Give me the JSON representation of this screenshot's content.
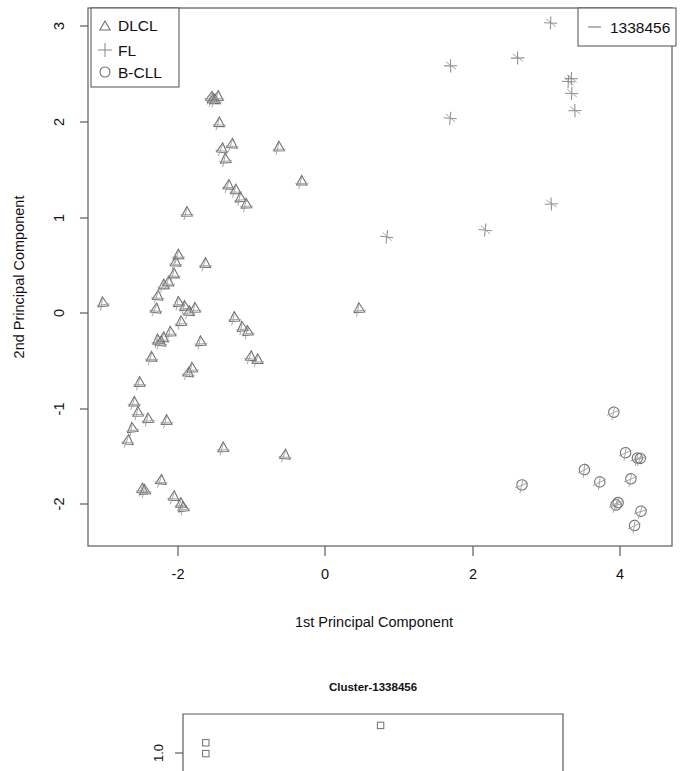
{
  "chart_data": {
    "type": "scatter",
    "title": "",
    "xlabel": "1st Principal Component",
    "ylabel": "2nd Principal Component",
    "xlim": [
      -3.2,
      4.6
    ],
    "ylim": [
      -2.45,
      3.15
    ],
    "xticks": [
      "-2",
      "0",
      "2",
      "4"
    ],
    "xtick_values": [
      -2,
      0,
      2,
      4
    ],
    "yticks": [
      "-2",
      "-1",
      "0",
      "1",
      "2",
      "3"
    ],
    "ytick_values": [
      -2,
      -1,
      0,
      1,
      2,
      3
    ],
    "grid": false,
    "legend_position": "top-left",
    "series": [
      {
        "name": "DLCL",
        "marker": "triangle",
        "color": "#6e6e6e",
        "points": [
          [
            -3.0,
            0.1
          ],
          [
            -2.66,
            -1.32
          ],
          [
            -2.63,
            -1.2
          ],
          [
            -2.6,
            -0.93
          ],
          [
            -2.55,
            -1.04
          ],
          [
            -2.52,
            -0.72
          ],
          [
            -2.48,
            -1.85
          ],
          [
            -2.45,
            -1.86
          ],
          [
            -2.4,
            -1.1
          ],
          [
            -2.34,
            -0.45
          ],
          [
            -2.3,
            0.05
          ],
          [
            -2.28,
            0.18
          ],
          [
            -2.26,
            -0.28
          ],
          [
            -2.24,
            -0.3
          ],
          [
            -2.22,
            -1.75
          ],
          [
            -2.2,
            0.3
          ],
          [
            -2.18,
            -0.26
          ],
          [
            -2.15,
            -1.12
          ],
          [
            -2.12,
            0.33
          ],
          [
            -2.1,
            -0.2
          ],
          [
            -2.06,
            -1.92
          ],
          [
            -2.04,
            0.42
          ],
          [
            -2.02,
            0.54
          ],
          [
            -2.0,
            0.6
          ],
          [
            -1.98,
            0.12
          ],
          [
            -1.96,
            -0.08
          ],
          [
            -1.95,
            -2.0
          ],
          [
            -1.92,
            -2.03
          ],
          [
            -1.9,
            0.08
          ],
          [
            -1.88,
            1.06
          ],
          [
            -1.86,
            -0.62
          ],
          [
            -1.84,
            0.02
          ],
          [
            -1.8,
            -0.58
          ],
          [
            -1.76,
            0.05
          ],
          [
            -1.7,
            -0.3
          ],
          [
            -1.62,
            0.52
          ],
          [
            -1.55,
            2.27
          ],
          [
            -1.52,
            2.25
          ],
          [
            -1.5,
            2.24
          ],
          [
            -1.46,
            2.26
          ],
          [
            -1.42,
            2.0
          ],
          [
            -1.4,
            1.72
          ],
          [
            -1.38,
            -1.4
          ],
          [
            -1.35,
            1.62
          ],
          [
            -1.3,
            1.35
          ],
          [
            -1.26,
            1.78
          ],
          [
            -1.22,
            -0.04
          ],
          [
            -1.2,
            1.3
          ],
          [
            -1.15,
            1.22
          ],
          [
            -1.12,
            -0.14
          ],
          [
            -1.08,
            1.15
          ],
          [
            -1.05,
            -0.2
          ],
          [
            -1.0,
            -0.46
          ],
          [
            -0.92,
            -0.48
          ],
          [
            -0.62,
            1.75
          ],
          [
            -0.55,
            -1.48
          ],
          [
            -0.3,
            1.38
          ],
          [
            0.45,
            0.05
          ]
        ]
      },
      {
        "name": "FL",
        "marker": "plus",
        "color": "#8e8e8e",
        "points": [
          [
            0.85,
            0.79
          ],
          [
            1.7,
            2.03
          ],
          [
            1.72,
            2.58
          ],
          [
            2.18,
            0.86
          ],
          [
            2.62,
            2.68
          ],
          [
            3.05,
            3.03
          ],
          [
            3.08,
            1.13
          ],
          [
            3.3,
            2.42
          ],
          [
            3.34,
            2.45
          ],
          [
            3.36,
            2.3
          ],
          [
            3.38,
            2.12
          ]
        ]
      },
      {
        "name": "B-CLL",
        "marker": "circle",
        "color": "#6e6e6e",
        "points": [
          [
            2.66,
            -1.8
          ],
          [
            3.52,
            -1.64
          ],
          [
            3.74,
            -1.78
          ],
          [
            3.92,
            -1.05
          ],
          [
            3.96,
            -2.0
          ],
          [
            3.98,
            -1.99
          ],
          [
            4.08,
            -1.46
          ],
          [
            4.14,
            -1.74
          ],
          [
            4.2,
            -2.22
          ],
          [
            4.24,
            -1.52
          ],
          [
            4.28,
            -1.53
          ],
          [
            4.3,
            -2.08
          ]
        ]
      }
    ]
  },
  "legend": {
    "items": [
      {
        "label": "DLCL",
        "marker": "triangle"
      },
      {
        "label": "FL",
        "marker": "plus"
      },
      {
        "label": "B-CLL",
        "marker": "circle"
      }
    ]
  },
  "cluster_legend": {
    "label": "1338456",
    "marker": "dash"
  },
  "bottom_panel": {
    "title": "Cluster-1338456",
    "yticks": [
      "1.0"
    ],
    "marker": "square",
    "points": [
      [
        0.06,
        1.02
      ],
      [
        0.06,
        0.86
      ],
      [
        0.52,
        1.28
      ]
    ],
    "xlim": [
      0,
      1
    ],
    "ylim": [
      0.6,
      1.45
    ]
  }
}
